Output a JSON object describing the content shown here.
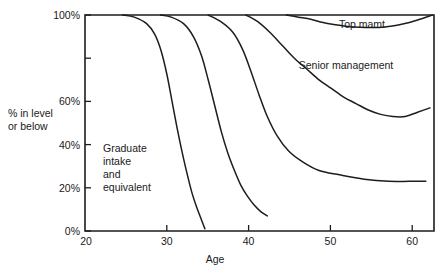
{
  "chart_data": {
    "type": "line",
    "title": "",
    "subtitle": "",
    "xlabel": "Age",
    "ylabel": "% in level or below",
    "xlim": [
      20,
      62.5
    ],
    "ylim": [
      0,
      100
    ],
    "grid": false,
    "legend_position": "inline-annotations",
    "x_ticks": [
      20,
      30,
      40,
      50,
      60
    ],
    "x_tick_labels": [
      "20",
      "30",
      "40",
      "50",
      "60"
    ],
    "y_ticks": [
      0,
      20,
      40,
      60,
      80,
      100
    ],
    "y_tick_labels": [
      "0%",
      "20%",
      "40%",
      "60%",
      "",
      "100%"
    ],
    "y_tick_labels_shown": [
      "0%",
      "20%",
      "40%",
      "60%",
      "100%"
    ],
    "annotations": [
      {
        "text": "Graduate intake and equivalent",
        "lines": [
          "Graduate",
          "intake",
          "and",
          "equivalent"
        ],
        "x": 23.5,
        "y": 37
      },
      {
        "text": "Senior management",
        "x": 44.5,
        "y": 77
      },
      {
        "text": "Top mamt",
        "x": 50.5,
        "y": 95
      }
    ],
    "series": [
      {
        "name": "Graduate intake and equivalent",
        "x": [
          24.6,
          26.0,
          27.5,
          28.5,
          29.3,
          30.0,
          30.6,
          31.2,
          31.8,
          32.4,
          33.0,
          33.6,
          34.2,
          34.6
        ],
        "values": [
          100,
          99,
          96,
          91,
          83,
          72,
          60,
          48,
          37,
          27,
          18,
          11,
          5,
          1
        ]
      },
      {
        "name": "Level 2",
        "x": [
          29.2,
          30.5,
          32.0,
          33.2,
          34.2,
          35.0,
          35.8,
          36.6,
          37.4,
          38.2,
          39.0,
          39.8,
          40.6,
          41.4,
          42.2
        ],
        "values": [
          100,
          99,
          96,
          90,
          81,
          70,
          58,
          46,
          36,
          28,
          21,
          16,
          12,
          9,
          7
        ]
      },
      {
        "name": "Level 3",
        "x": [
          35.0,
          36.5,
          38.0,
          39.2,
          40.2,
          41.2,
          42.2,
          43.4,
          44.8,
          46.5,
          48.5,
          51.0,
          54.0,
          57.0,
          59.5,
          61.5
        ],
        "values": [
          100,
          97,
          92,
          84,
          74,
          63,
          53,
          44,
          37,
          32,
          28,
          26,
          24,
          23,
          23,
          23
        ]
      },
      {
        "name": "Senior management",
        "x": [
          39.6,
          41.0,
          42.5,
          44.0,
          45.5,
          47.0,
          48.5,
          50.0,
          51.5,
          53.0,
          54.5,
          56.0,
          57.5,
          59.0,
          60.5,
          62.0
        ],
        "values": [
          100,
          97,
          92,
          86,
          80,
          75,
          70,
          66,
          62,
          59,
          56,
          54,
          53,
          53,
          55,
          57
        ]
      },
      {
        "name": "Top mamt",
        "x": [
          44.5,
          46.0,
          47.5,
          49.0,
          50.5,
          52.0,
          53.5,
          55.0,
          56.5,
          58.0,
          59.5,
          61.0,
          62.3
        ],
        "values": [
          100,
          99,
          98,
          96.5,
          95.5,
          94.7,
          94.3,
          94.2,
          94.5,
          95.3,
          96.5,
          98.3,
          100
        ]
      }
    ]
  },
  "axes": {
    "y_title_line1": "% in level",
    "y_title_line2": "or below",
    "x_title": "Age"
  },
  "labels": {
    "y0": "0%",
    "y20": "20%",
    "y40": "40%",
    "y60": "60%",
    "y100": "100%",
    "x20": "20",
    "x30": "30",
    "x40": "40",
    "x50": "50",
    "x60": "60"
  },
  "annotations": {
    "graduate_l1": "Graduate",
    "graduate_l2": "intake",
    "graduate_l3": "and",
    "graduate_l4": "equivalent",
    "senior": "Senior management",
    "top": "Top mamt"
  },
  "colors": {
    "ink": "#1d1d1d",
    "background": "#ffffff"
  }
}
